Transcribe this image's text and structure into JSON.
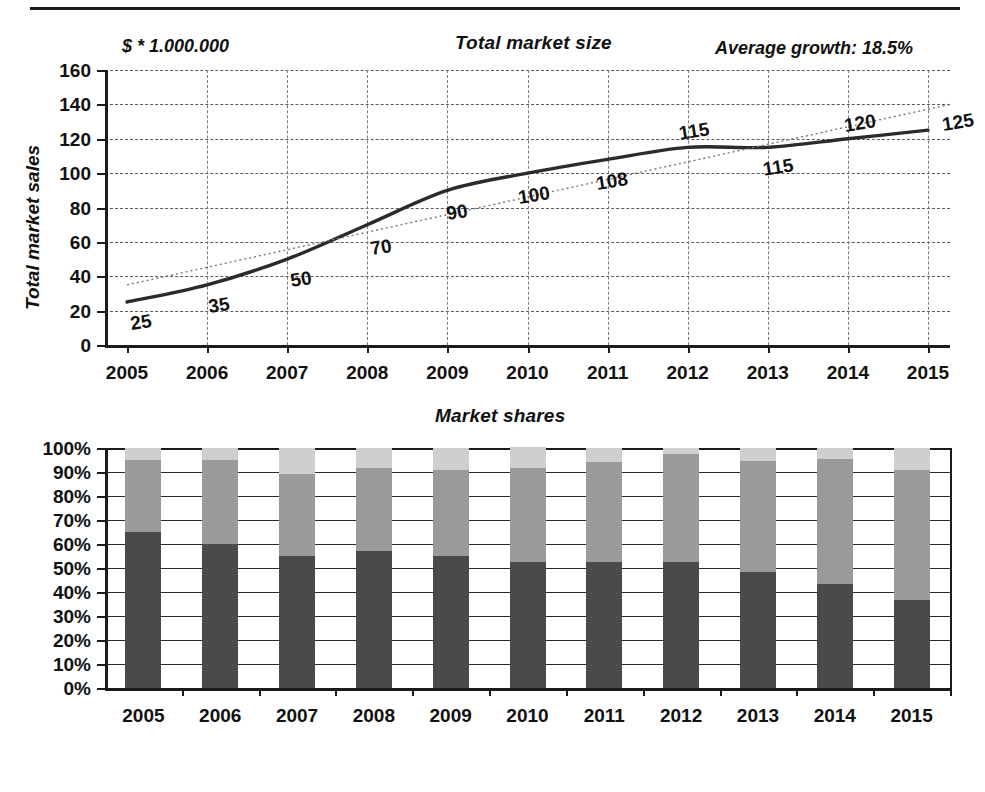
{
  "figure": {
    "divider": "horizontal-rule"
  },
  "top_chart": {
    "title": "Total market size",
    "unit_note": "$ * 1.000.000",
    "growth_note": "Average growth: 18.5%",
    "y_axis_title": "Total market sales",
    "y_ticks": [
      "160",
      "140",
      "120",
      "100",
      "80",
      "60",
      "40",
      "20",
      "0"
    ],
    "x_ticks": [
      "2005",
      "2006",
      "2007",
      "2008",
      "2009",
      "2010",
      "2011",
      "2012",
      "2013",
      "2014",
      "2015"
    ],
    "point_labels": [
      "25",
      "35",
      "50",
      "70",
      "90",
      "100",
      "108",
      "115",
      "115",
      "120",
      "125"
    ]
  },
  "bottom_chart": {
    "title": "Market shares",
    "y_ticks": [
      "100%",
      "90%",
      "80%",
      "70%",
      "60%",
      "50%",
      "40%",
      "30%",
      "20%",
      "10%",
      "0%"
    ],
    "x_ticks": [
      "2005",
      "2006",
      "2007",
      "2008",
      "2009",
      "2010",
      "2011",
      "2012",
      "2013",
      "2014",
      "2015"
    ],
    "legend": [
      {
        "label": "emerging players",
        "color": "#cfcfcf"
      },
      {
        "label": "major contenders",
        "color": "#9a9a9a"
      },
      {
        "label": "leaders",
        "color": "#4a4a4a"
      }
    ]
  },
  "chart_data": [
    {
      "type": "line",
      "title": "Total market size",
      "subtitle": "Average growth: 18.5%",
      "xlabel": "",
      "ylabel": "Total market sales",
      "unit": "$ * 1.000.000",
      "grid": true,
      "ylim": [
        0,
        160
      ],
      "ytick_step": 20,
      "categories": [
        "2005",
        "2006",
        "2007",
        "2008",
        "2009",
        "2010",
        "2011",
        "2012",
        "2013",
        "2014",
        "2015"
      ],
      "series": [
        {
          "name": "Total market sales",
          "style": "solid-thick",
          "labels_shown": true,
          "values": [
            25,
            35,
            50,
            70,
            90,
            100,
            108,
            115,
            115,
            120,
            125
          ]
        },
        {
          "name": "linear trend",
          "style": "dotted-thin",
          "labels_shown": false,
          "values": [
            35,
            45.5,
            56,
            66.5,
            77,
            87.5,
            98,
            108.5,
            119,
            129.5,
            140
          ]
        }
      ]
    },
    {
      "type": "bar",
      "stacked": true,
      "stack_total": 100,
      "title": "Market shares",
      "xlabel": "",
      "ylabel": "",
      "grid": true,
      "ylim": [
        0,
        100
      ],
      "ytick_step": 10,
      "yunit": "%",
      "legend_position": "bottom",
      "categories": [
        "2005",
        "2006",
        "2007",
        "2008",
        "2009",
        "2010",
        "2011",
        "2012",
        "2013",
        "2014",
        "2015"
      ],
      "series": [
        {
          "name": "leaders",
          "color": "#4a4a4a",
          "values": [
            65,
            60,
            55,
            57,
            55,
            52.5,
            52.5,
            52.5,
            48.5,
            43.5,
            36.5
          ]
        },
        {
          "name": "major contenders",
          "color": "#9a9a9a",
          "values": [
            30,
            35,
            34,
            34.5,
            36,
            39,
            41.5,
            45,
            46,
            52,
            54.5
          ]
        },
        {
          "name": "emerging players",
          "color": "#cfcfcf",
          "values": [
            5,
            5,
            11,
            8.5,
            9,
            9,
            6,
            2.5,
            5.5,
            4.5,
            9
          ]
        }
      ]
    }
  ]
}
